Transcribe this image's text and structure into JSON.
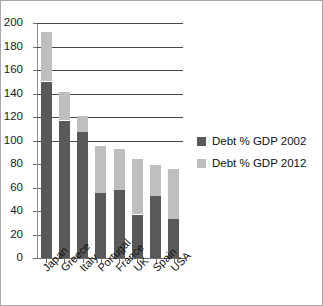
{
  "chart_data": {
    "type": "bar",
    "subtype": "stacked-bar",
    "title": "",
    "subtitle": "",
    "xlabel": "",
    "ylabel": "",
    "ylim": [
      0,
      200
    ],
    "ytick_step": 20,
    "ytick_labels": [
      "200",
      "180",
      "160",
      "140",
      "120",
      "100",
      "80",
      "60",
      "40",
      "20",
      "0"
    ],
    "ytick_values": [
      200,
      180,
      160,
      140,
      120,
      100,
      80,
      60,
      40,
      20,
      0
    ],
    "gridlines_at": [
      100,
      120,
      140,
      160,
      180,
      200
    ],
    "grid": true,
    "legend_position": "right",
    "categories": [
      "Japan",
      "Greece",
      "Italy",
      "Portugal",
      "France",
      "UK",
      "Spain",
      "USA"
    ],
    "series": [
      {
        "name": "Debt % GDP 2002",
        "color": "#595959",
        "values": [
          150,
          117,
          107,
          55,
          58,
          37,
          53,
          33
        ]
      },
      {
        "name": "Debt % GDP 2012",
        "color": "#bfbfbf",
        "values": [
          192,
          141,
          121,
          95,
          93,
          84,
          79,
          76
        ]
      }
    ]
  },
  "legend": {
    "entries": [
      {
        "label": "Debt % GDP 2002",
        "color": "#595959"
      },
      {
        "label": "Debt % GDP 2012",
        "color": "#bfbfbf"
      }
    ]
  }
}
